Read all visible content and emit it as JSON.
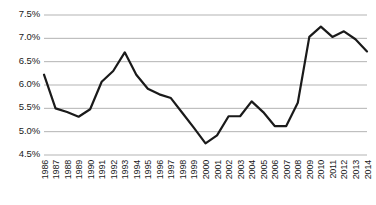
{
  "chart_data": {
    "type": "line",
    "title": "",
    "xlabel": "",
    "ylabel": "",
    "categories": [
      "1986",
      "1987",
      "1988",
      "1989",
      "1990",
      "1991",
      "1992",
      "1993",
      "1994",
      "1995",
      "1996",
      "1997",
      "1998",
      "1999",
      "2000",
      "2001",
      "2002",
      "2003",
      "2004",
      "2005",
      "2006",
      "2007",
      "2008",
      "2009",
      "2010",
      "2011",
      "2012",
      "2013",
      "2014"
    ],
    "values": [
      6.22,
      5.5,
      5.42,
      5.32,
      5.48,
      6.07,
      6.3,
      6.7,
      6.22,
      5.92,
      5.8,
      5.72,
      5.4,
      5.08,
      4.75,
      4.92,
      5.33,
      5.33,
      5.65,
      5.42,
      5.12,
      5.12,
      5.62,
      7.03,
      7.25,
      7.03,
      7.15,
      6.98,
      6.72
    ],
    "value_suffix": "%",
    "ylim": [
      4.5,
      7.5
    ],
    "ytick_values": [
      7.5,
      7.0,
      6.5,
      6.0,
      5.5,
      5.0,
      4.5
    ],
    "ytick_labels": [
      "7.5%",
      "7.0%",
      "6.5%",
      "6.0%",
      "5.5%",
      "5.0%",
      "4.5%"
    ],
    "grid": true,
    "grid_axis": "y",
    "legend": false,
    "legend_position": "none",
    "series": [
      {
        "name": "",
        "color": "#1a1a1a",
        "line_width": 2.2,
        "markers": false,
        "values": [
          6.22,
          5.5,
          5.42,
          5.32,
          5.48,
          6.07,
          6.3,
          6.7,
          6.22,
          5.92,
          5.8,
          5.72,
          5.4,
          5.08,
          4.75,
          4.92,
          5.33,
          5.33,
          5.65,
          5.42,
          5.12,
          5.12,
          5.62,
          7.03,
          7.25,
          7.03,
          7.15,
          6.98,
          6.72
        ]
      }
    ],
    "colors": {
      "line": "#1a1a1a",
      "grid": "#b3b3b3",
      "background": "#ffffff",
      "text": "#1a1a1a"
    }
  }
}
